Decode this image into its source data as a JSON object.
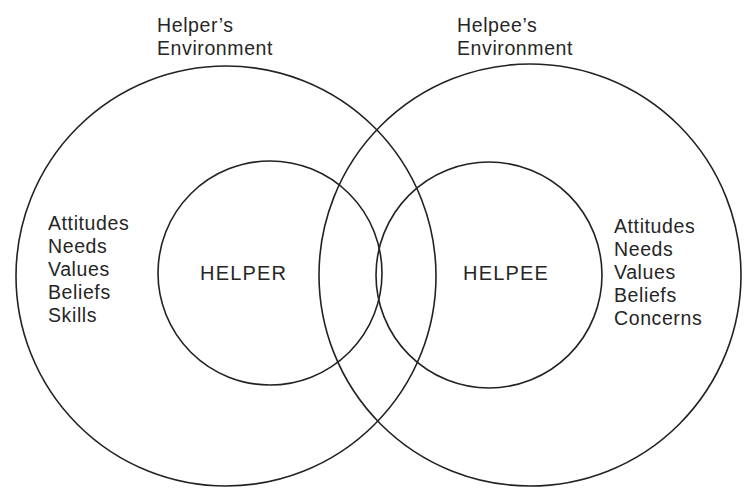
{
  "diagram": {
    "type": "overlapping-circles",
    "stroke_color": "#222222",
    "text_color": "#262626",
    "background": "#ffffff",
    "helper": {
      "environment_label": [
        "Helper’s",
        "Environment"
      ],
      "core_label": "HELPER",
      "attributes": [
        "Attitudes",
        "Needs",
        "Values",
        "Beliefs",
        "Skills"
      ]
    },
    "helpee": {
      "environment_label": [
        "Helpee’s",
        "Environment"
      ],
      "core_label": "HELPEE",
      "attributes": [
        "Attitudes",
        "Needs",
        "Values",
        "Beliefs",
        "Concerns"
      ]
    }
  }
}
